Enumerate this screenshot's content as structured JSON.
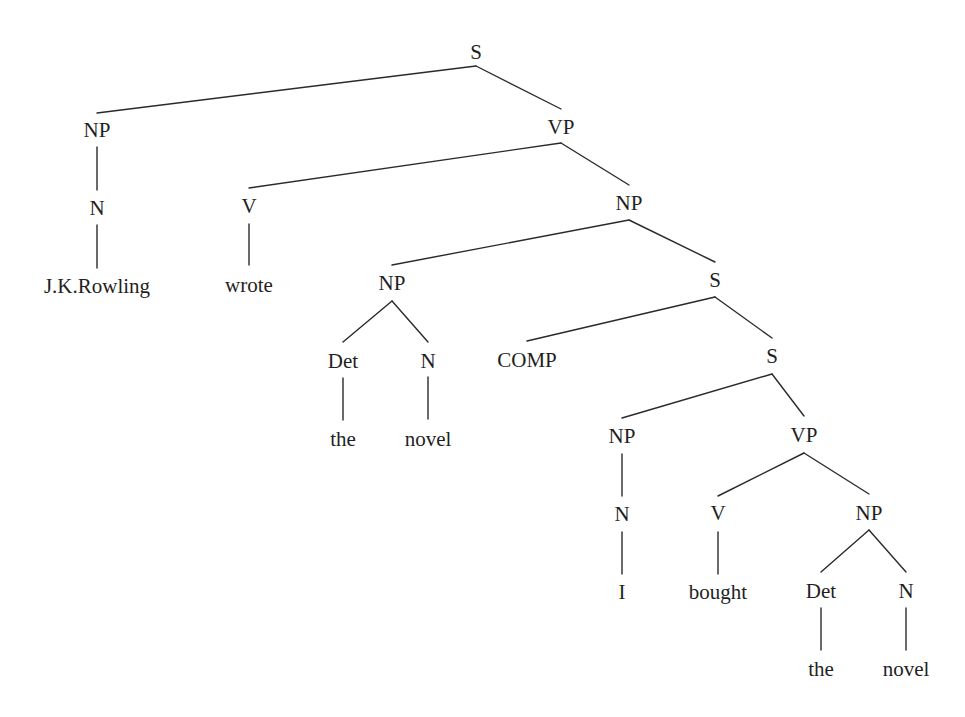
{
  "diagram": {
    "type": "syntax-tree",
    "sentence": "J.K.Rowling wrote the novel I bought the novel",
    "colors": {
      "line": "#2a2a2a",
      "text": "#1f1f1f",
      "background": "#ffffff"
    },
    "nodes": [
      {
        "id": "n0",
        "label": "S",
        "x": 476,
        "y": 52,
        "top": 36,
        "bottom": 66
      },
      {
        "id": "n1",
        "label": "NP",
        "x": 97,
        "y": 130,
        "top": 113,
        "bottom": 147
      },
      {
        "id": "n2",
        "label": "VP",
        "x": 561,
        "y": 127,
        "top": 109,
        "bottom": 143
      },
      {
        "id": "n3",
        "label": "N",
        "x": 97,
        "y": 208,
        "top": 190,
        "bottom": 225
      },
      {
        "id": "n4",
        "label": "J.K.Rowling",
        "x": 97,
        "y": 286,
        "top": 268,
        "bottom": 300
      },
      {
        "id": "n5",
        "label": "V",
        "x": 249,
        "y": 206,
        "top": 188,
        "bottom": 224
      },
      {
        "id": "n6",
        "label": "wrote",
        "x": 249,
        "y": 285,
        "top": 265,
        "bottom": 300
      },
      {
        "id": "n7",
        "label": "NP",
        "x": 629,
        "y": 203,
        "top": 185,
        "bottom": 220
      },
      {
        "id": "n8",
        "label": "NP",
        "x": 392,
        "y": 283,
        "top": 265,
        "bottom": 301
      },
      {
        "id": "n9",
        "label": "Det",
        "x": 343,
        "y": 361,
        "top": 342,
        "bottom": 378
      },
      {
        "id": "n10",
        "label": "the",
        "x": 343,
        "y": 439,
        "top": 420,
        "bottom": 455
      },
      {
        "id": "n11",
        "label": "N",
        "x": 428,
        "y": 361,
        "top": 342,
        "bottom": 377
      },
      {
        "id": "n12",
        "label": "novel",
        "x": 428,
        "y": 439,
        "top": 419,
        "bottom": 455
      },
      {
        "id": "n13",
        "label": "S",
        "x": 715,
        "y": 280,
        "top": 262,
        "bottom": 297
      },
      {
        "id": "n14",
        "label": "COMP",
        "x": 527,
        "y": 360,
        "top": 341,
        "bottom": 376
      },
      {
        "id": "n15",
        "label": "S",
        "x": 772,
        "y": 356,
        "top": 338,
        "bottom": 374
      },
      {
        "id": "n16",
        "label": "NP",
        "x": 622,
        "y": 436,
        "top": 418,
        "bottom": 454
      },
      {
        "id": "n17",
        "label": "N",
        "x": 622,
        "y": 514,
        "top": 496,
        "bottom": 532
      },
      {
        "id": "n18",
        "label": "I",
        "x": 622,
        "y": 592,
        "top": 574,
        "bottom": 608
      },
      {
        "id": "n19",
        "label": "VP",
        "x": 804,
        "y": 435,
        "top": 416,
        "bottom": 453
      },
      {
        "id": "n20",
        "label": "V",
        "x": 718,
        "y": 513,
        "top": 496,
        "bottom": 532
      },
      {
        "id": "n21",
        "label": "bought",
        "x": 718,
        "y": 592,
        "top": 574,
        "bottom": 608
      },
      {
        "id": "n22",
        "label": "NP",
        "x": 869,
        "y": 513,
        "top": 494,
        "bottom": 530
      },
      {
        "id": "n23",
        "label": "Det",
        "x": 821,
        "y": 591,
        "top": 572,
        "bottom": 608
      },
      {
        "id": "n24",
        "label": "the",
        "x": 821,
        "y": 669,
        "top": 650,
        "bottom": 685
      },
      {
        "id": "n25",
        "label": "N",
        "x": 906,
        "y": 591,
        "top": 572,
        "bottom": 608
      },
      {
        "id": "n26",
        "label": "novel",
        "x": 906,
        "y": 669,
        "top": 650,
        "bottom": 685
      }
    ],
    "edges": [
      [
        "n0",
        "n1"
      ],
      [
        "n0",
        "n2"
      ],
      [
        "n1",
        "n3"
      ],
      [
        "n3",
        "n4"
      ],
      [
        "n2",
        "n5"
      ],
      [
        "n2",
        "n7"
      ],
      [
        "n5",
        "n6"
      ],
      [
        "n7",
        "n8"
      ],
      [
        "n7",
        "n13"
      ],
      [
        "n8",
        "n9"
      ],
      [
        "n8",
        "n11"
      ],
      [
        "n9",
        "n10"
      ],
      [
        "n11",
        "n12"
      ],
      [
        "n13",
        "n14"
      ],
      [
        "n13",
        "n15"
      ],
      [
        "n15",
        "n16"
      ],
      [
        "n15",
        "n19"
      ],
      [
        "n16",
        "n17"
      ],
      [
        "n17",
        "n18"
      ],
      [
        "n19",
        "n20"
      ],
      [
        "n19",
        "n22"
      ],
      [
        "n20",
        "n21"
      ],
      [
        "n22",
        "n23"
      ],
      [
        "n22",
        "n25"
      ],
      [
        "n23",
        "n24"
      ],
      [
        "n25",
        "n26"
      ]
    ]
  }
}
